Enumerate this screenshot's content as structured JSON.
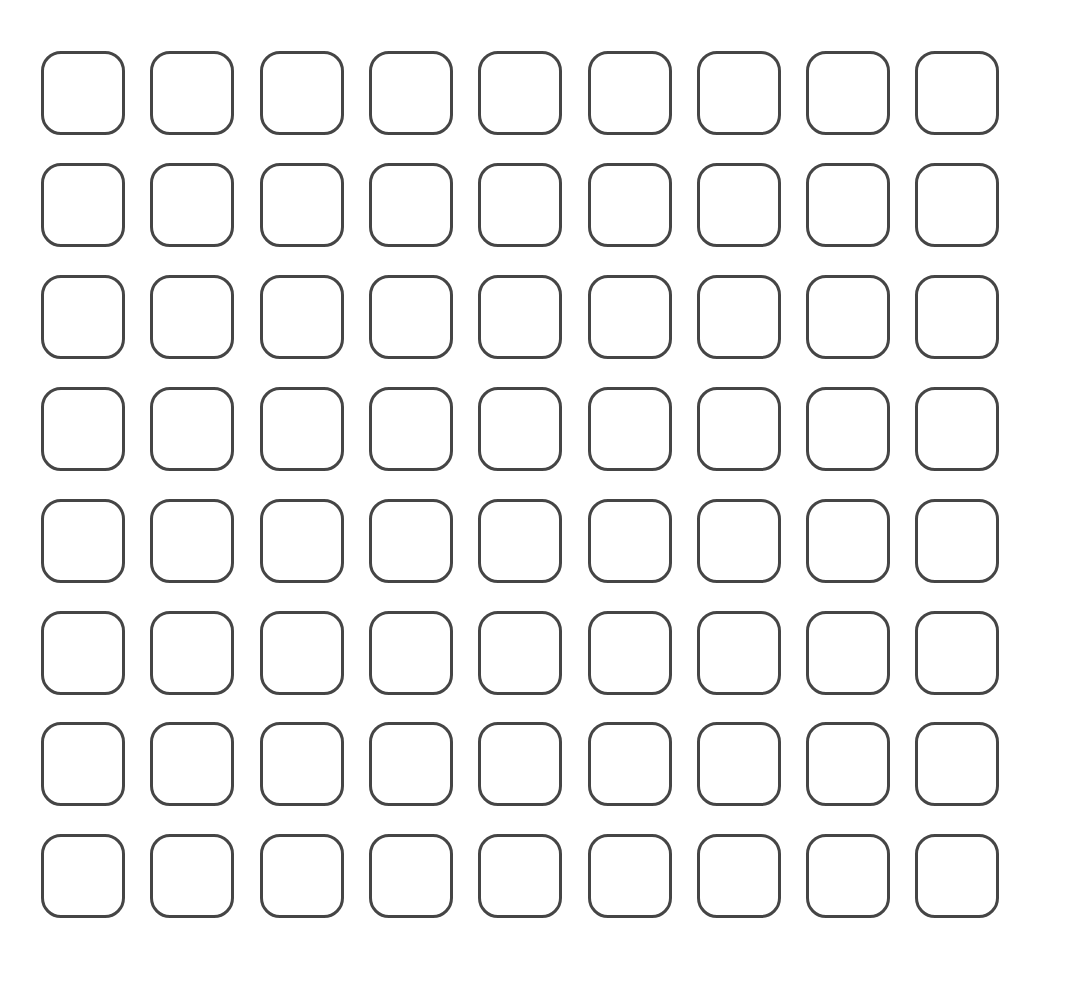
{
  "grid": {
    "rows": 8,
    "cols": 9,
    "origin_x": 41,
    "origin_y": 51,
    "col_pitch": 109.3,
    "row_pitch": 111.9,
    "cell_size": 84,
    "corner_radius": 20,
    "stroke_width": 3,
    "stroke_color": "#454545",
    "fill_color": "#ffffff",
    "background": "#ffffff",
    "cells_state": "empty"
  }
}
